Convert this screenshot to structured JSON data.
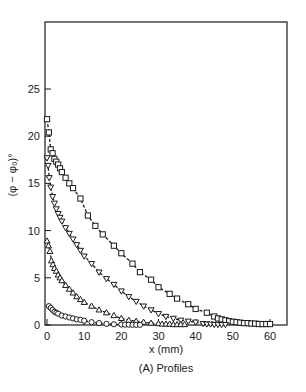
{
  "chart_data": {
    "type": "scatter",
    "title": "",
    "caption": "(A) Profiles",
    "xlabel": "x (mm)",
    "ylabel": "(φ − φ₀)°",
    "xlim": [
      0,
      64
    ],
    "ylim": [
      0,
      30
    ],
    "x_ticks": [
      0,
      10,
      20,
      30,
      40,
      50,
      60
    ],
    "y_ticks": [
      0,
      5,
      10,
      15,
      20,
      25
    ],
    "grid": false,
    "legend": null,
    "series": [
      {
        "name": "squares",
        "marker": "square",
        "x": [
          0,
          0.5,
          1,
          1.5,
          2,
          2.5,
          3,
          3.5,
          4,
          5,
          6,
          7,
          9,
          11,
          13,
          15,
          18,
          20,
          23,
          25,
          28,
          30,
          33,
          35,
          38,
          40,
          43,
          45,
          46,
          47,
          48,
          49,
          50,
          51,
          52,
          53,
          54,
          55,
          56,
          57,
          58,
          59,
          60
        ],
        "y": [
          21.8,
          20.4,
          18.6,
          18.2,
          17.6,
          17.3,
          17.0,
          16.6,
          16.2,
          15.6,
          15.0,
          14.5,
          13.4,
          11.6,
          10.5,
          9.6,
          8.4,
          7.6,
          6.5,
          5.6,
          4.8,
          4.0,
          3.3,
          2.8,
          2.2,
          1.7,
          1.3,
          0.9,
          0.7,
          0.6,
          0.5,
          0.4,
          0.35,
          0.3,
          0.25,
          0.2,
          0.2,
          0.15,
          0.15,
          0.1,
          0.1,
          0.1,
          0.1
        ]
      },
      {
        "name": "down-triangles",
        "marker": "triangle-down",
        "x": [
          0,
          0.3,
          0.6,
          1,
          1.5,
          2,
          2.5,
          3,
          3.5,
          4,
          5,
          6,
          7,
          8,
          9,
          10,
          12,
          14,
          16,
          18,
          20,
          22,
          24,
          26,
          28,
          30,
          32,
          34,
          36,
          38,
          40,
          42,
          43,
          44,
          45,
          46,
          47,
          48
        ],
        "y": [
          17.7,
          16.9,
          15.6,
          14.6,
          13.6,
          12.9,
          12.3,
          11.8,
          11.4,
          11.0,
          10.3,
          9.7,
          9.1,
          8.5,
          7.9,
          7.3,
          6.5,
          5.6,
          4.9,
          4.3,
          3.6,
          3.0,
          2.5,
          2.0,
          1.6,
          1.2,
          0.9,
          0.7,
          0.5,
          0.4,
          0.3,
          0.15,
          0.1,
          0.1,
          0.05,
          0.05,
          0.05,
          0.05
        ]
      },
      {
        "name": "up-triangles",
        "marker": "triangle-up",
        "x": [
          0,
          0.4,
          0.8,
          1.2,
          1.6,
          2,
          2.5,
          3,
          3.5,
          4,
          5,
          6,
          7,
          8,
          9,
          10,
          12,
          14,
          16,
          18,
          20,
          22,
          24,
          26,
          28,
          30,
          31,
          32,
          33,
          34,
          35,
          36,
          37
        ],
        "y": [
          8.9,
          8.4,
          7.8,
          6.8,
          6.4,
          6.0,
          5.7,
          5.3,
          5.0,
          4.7,
          4.2,
          3.8,
          3.4,
          3.0,
          2.7,
          2.4,
          2.0,
          1.6,
          1.3,
          1.0,
          0.7,
          0.5,
          0.4,
          0.3,
          0.2,
          0.15,
          0.1,
          0.1,
          0.1,
          0.05,
          0.05,
          0.05,
          0.05
        ]
      },
      {
        "name": "circles",
        "marker": "circle",
        "x": [
          0.5,
          1,
          1.5,
          2,
          2.5,
          3,
          4,
          5,
          6,
          7,
          8,
          9,
          10,
          12,
          14,
          16,
          18,
          20,
          21,
          22,
          23,
          24,
          25
        ],
        "y": [
          2.0,
          1.8,
          1.6,
          1.4,
          1.3,
          1.2,
          1.0,
          0.9,
          0.8,
          0.7,
          0.6,
          0.55,
          0.45,
          0.3,
          0.2,
          0.12,
          0.08,
          0.05,
          0.04,
          0.03,
          0.02,
          0.02,
          0.02
        ]
      }
    ]
  },
  "labels": {
    "caption": "(A) Profiles",
    "xlabel": "x (mm)",
    "ylabel": "(φ − φ₀)°"
  },
  "colors": {
    "ink": "#1a1a1a",
    "background": "#ffffff"
  }
}
